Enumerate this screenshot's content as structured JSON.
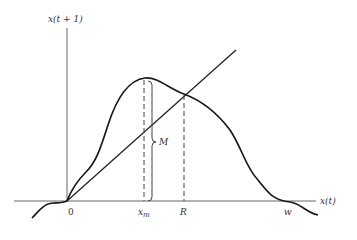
{
  "figure": {
    "type": "diagram",
    "colors": {
      "curve": "#1a1a1a",
      "axis": "#555555",
      "text": "#333333"
    }
  },
  "axes": {
    "y_label": "x(t + 1)",
    "x_label": "x(t)"
  },
  "labels": {
    "origin": "0",
    "x_max": "x",
    "x_max_sub": "m",
    "fixed_point": "R",
    "root": "w",
    "brace_label": "M"
  }
}
